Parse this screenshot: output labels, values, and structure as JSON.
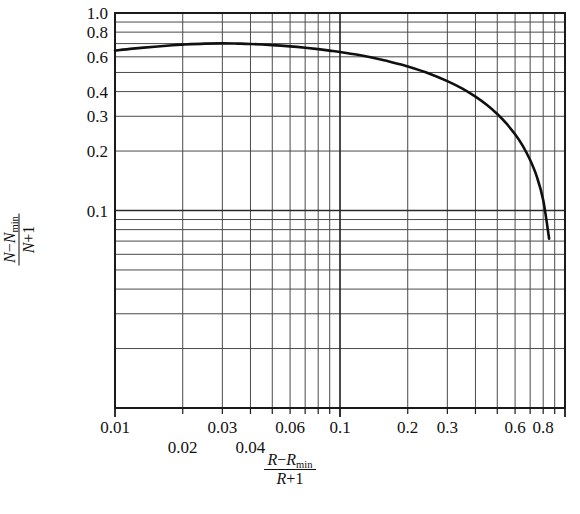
{
  "chart_data": {
    "type": "line",
    "title": "",
    "xlabel": "(R - Rmin)/(R + 1)",
    "ylabel": "(N - Nmin)/(N + 1)",
    "xscale": "log",
    "yscale": "log",
    "xlim": [
      0.01,
      1.0
    ],
    "ylim": [
      0.01,
      1.0
    ],
    "grid": true,
    "legend": "none",
    "x_tick_labels_upper": [
      "0.01",
      "0.03",
      "0.06",
      "0.1",
      "0.2",
      "0.3",
      "0.6",
      "0.8"
    ],
    "x_tick_values_upper": [
      0.01,
      0.03,
      0.06,
      0.1,
      0.2,
      0.3,
      0.6,
      0.8
    ],
    "x_tick_labels_lower": [
      "0.02",
      "0.04"
    ],
    "x_tick_values_lower": [
      0.02,
      0.04
    ],
    "y_tick_labels": [
      "1.0",
      "0.8",
      "0.6",
      "0.4",
      "0.3",
      "0.2",
      "0.1"
    ],
    "y_tick_values": [
      1.0,
      0.8,
      0.6,
      0.4,
      0.3,
      0.2,
      0.1
    ],
    "series": [
      {
        "name": "Gilliland correlation",
        "color": "#101010",
        "x": [
          0.01,
          0.012,
          0.015,
          0.018,
          0.02,
          0.025,
          0.03,
          0.035,
          0.04,
          0.05,
          0.06,
          0.07,
          0.08,
          0.09,
          0.1,
          0.12,
          0.15,
          0.18,
          0.2,
          0.25,
          0.3,
          0.35,
          0.4,
          0.45,
          0.5,
          0.55,
          0.6,
          0.65,
          0.7,
          0.75,
          0.8,
          0.85
        ],
        "y": [
          0.645,
          0.66,
          0.675,
          0.687,
          0.692,
          0.7,
          0.702,
          0.7,
          0.697,
          0.688,
          0.678,
          0.667,
          0.656,
          0.645,
          0.635,
          0.614,
          0.583,
          0.554,
          0.536,
          0.493,
          0.452,
          0.414,
          0.377,
          0.342,
          0.308,
          0.275,
          0.243,
          0.212,
          0.18,
          0.148,
          0.113,
          0.072
        ]
      }
    ]
  },
  "axis_titles": {
    "x": {
      "numerator_a": "R",
      "minus": "−",
      "numerator_b": "R",
      "numerator_b_sub": "min",
      "denominator_a": "R",
      "plus": "+",
      "denominator_b": "1"
    },
    "y": {
      "numerator_a": "N",
      "minus": "−",
      "numerator_b": "N",
      "numerator_b_sub": "min",
      "denominator_a": "N",
      "plus": "+",
      "denominator_b": "1"
    }
  },
  "style": {
    "background": "#ffffff",
    "axis_color": "#1a1a1a",
    "grid_major_color": "#2b2b2b",
    "grid_minor_color": "#4a4a4a",
    "curve_color": "#101010"
  }
}
